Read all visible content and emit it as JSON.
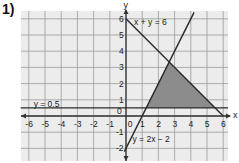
{
  "problem_number": "1)",
  "chart_data": {
    "type": "line",
    "title": "",
    "xlabel": "x",
    "ylabel": "y",
    "xlim": [
      -6.5,
      6.3
    ],
    "ylim": [
      -2.6,
      6.5
    ],
    "grid": true,
    "x_ticks": [
      -6,
      -5,
      -4,
      -3,
      -2,
      -1,
      0,
      1,
      2,
      3,
      4,
      5,
      6
    ],
    "y_ticks": [
      -2,
      -1,
      0,
      1,
      2,
      3,
      4,
      5,
      6
    ],
    "x_tick_labels": [
      "-6",
      "-5",
      "-4",
      "-3",
      "-2",
      "-1",
      "0",
      "1",
      "2",
      "3",
      "4",
      "5",
      "6"
    ],
    "y_tick_labels": [
      "-2",
      "-1",
      "0",
      "1",
      "2",
      "3",
      "4",
      "5",
      "6"
    ],
    "series": [
      {
        "name": "x + y = 6",
        "equation": "x + y = 6",
        "points": [
          [
            0,
            6
          ],
          [
            6,
            0
          ]
        ],
        "label_pos": [
          0.5,
          5.8
        ]
      },
      {
        "name": "y = 2x - 2",
        "equation": "y = 2x − 2",
        "points": [
          [
            -0.1,
            -2.2
          ],
          [
            4.2,
            6.4
          ]
        ],
        "label_pos": [
          0.4,
          -1.4
        ]
      },
      {
        "name": "y = 0.5",
        "equation": "y = 0.5",
        "points": [
          [
            -6.5,
            0.5
          ],
          [
            6.3,
            0.5
          ]
        ],
        "label_pos": [
          -5.7,
          0.75
        ]
      }
    ],
    "shaded_region": {
      "description": "Feasible region bounded by y = 0.5, y = 2x - 2 and x + y = 6",
      "vertices": [
        [
          1.25,
          0.5
        ],
        [
          2.6667,
          3.3333
        ],
        [
          5.5,
          0.5
        ]
      ],
      "color": "#8c8c8c"
    }
  },
  "colors": {
    "grid_bg": "#ececec",
    "grid_line": "#9a9a9a",
    "axis": "#333333",
    "line": "#2a2a2a",
    "shade": "#8c8c8c"
  }
}
